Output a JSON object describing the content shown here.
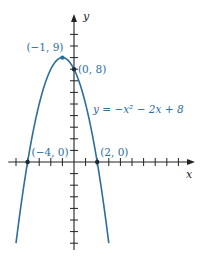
{
  "chart_data": {
    "type": "line",
    "title": "",
    "function": "y = -x^2 - 2x + 8",
    "equation_label": "y = −x² − 2x + 8",
    "xlabel": "x",
    "ylabel": "y",
    "xlim": [
      -5.5,
      10.5
    ],
    "ylim": [
      -7.5,
      11.5
    ],
    "x_ticks": [
      -5,
      -4,
      -3,
      -2,
      -1,
      1,
      2,
      3,
      4,
      5,
      6,
      7,
      8,
      9
    ],
    "y_ticks": [
      -7,
      -6,
      -5,
      -4,
      -3,
      -2,
      -1,
      1,
      2,
      3,
      4,
      5,
      6,
      7,
      8,
      9,
      10,
      11
    ],
    "grid": false,
    "series": [
      {
        "name": "y = −x² − 2x + 8",
        "x_range": [
          -5,
          3
        ],
        "color": "#2a6f9e"
      }
    ],
    "points": [
      {
        "name": "vertex",
        "x": -1,
        "y": 9,
        "label": "(−1, 9)"
      },
      {
        "name": "y-intercept",
        "x": 0,
        "y": 8,
        "label": "(0, 8)"
      },
      {
        "name": "x-intercept-left",
        "x": -4,
        "y": 0,
        "label": "(−4, 0)"
      },
      {
        "name": "x-intercept-right",
        "x": 2,
        "y": 0,
        "label": "(2, 0)"
      }
    ]
  },
  "colors": {
    "curve": "#2a6f9e",
    "axis": "#222222",
    "label": "#2a6f9e"
  }
}
